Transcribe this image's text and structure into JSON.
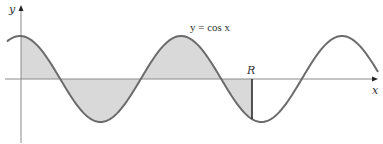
{
  "figure": {
    "cutoff_top_text": "· · · · · ·",
    "equation_label": "y = cos x",
    "y_axis_label": "y",
    "x_axis_label": "x",
    "point_label": "R",
    "colors": {
      "curve": "#6b6b6b",
      "axis": "#8a8a8a",
      "shading": "#d9d9d9",
      "marker_line": "#2a2a2a",
      "text": "#333333",
      "background": "#ffffff"
    }
  },
  "chart_data": {
    "type": "line",
    "title": "",
    "function": "y = cos x",
    "xlabel": "x",
    "ylabel": "y",
    "grid": false,
    "legend": null,
    "annotations": [
      {
        "text": "y = cos x",
        "position": "above second peak"
      },
      {
        "text": "R",
        "position": "at vertical line bounding shaded region, near third trough"
      }
    ],
    "shaded_region": {
      "description": "Area between y = cos x and the x-axis from x = 0 to x = R",
      "x_start": 0,
      "x_end_label": "R",
      "x_end_approx_radians": 9.06
    },
    "curve_extent_radians": [
      -0.55,
      14.15
    ],
    "peaks_radians": [
      0,
      6.283,
      12.566
    ],
    "troughs_radians": [
      3.142,
      9.425
    ],
    "amplitude": 1,
    "pixel_geometry": {
      "axis_y": 79,
      "y_axis_x": 21,
      "amplitude_px": 43,
      "period_px": 161,
      "first_peak_x": 20,
      "curve_x_start": 7,
      "curve_x_end": 378,
      "shade_x_start": 21,
      "shade_x_end": 252,
      "x_axis_x_start": 5,
      "x_axis_x_end": 378,
      "y_axis_y_top": 6,
      "y_axis_y_bottom": 143
    }
  }
}
